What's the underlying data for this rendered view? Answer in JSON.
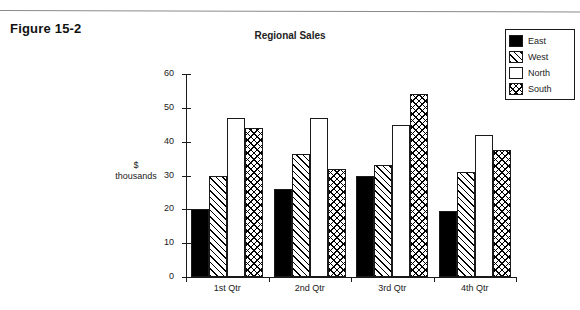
{
  "figure": {
    "label": "Figure 15-2"
  },
  "chart_data": {
    "type": "bar",
    "title": "Regional Sales",
    "xlabel": "",
    "ylabel": "$ thousands",
    "ylabel_lines": [
      "$",
      "thousands"
    ],
    "categories": [
      "1st Qtr",
      "2nd Qtr",
      "3rd Qtr",
      "4th Qtr"
    ],
    "series": [
      {
        "name": "East",
        "values": [
          20,
          26,
          30,
          19.5
        ],
        "fill": "solid"
      },
      {
        "name": "West",
        "values": [
          30,
          36.5,
          33,
          31
        ],
        "fill": "diagonal-hatch"
      },
      {
        "name": "North",
        "values": [
          47,
          47,
          45,
          42
        ],
        "fill": "none"
      },
      {
        "name": "South",
        "values": [
          44,
          32,
          54,
          37.5
        ],
        "fill": "cross-hatch"
      }
    ],
    "ylim": [
      0,
      60
    ],
    "yticks": [
      0,
      10,
      20,
      30,
      40,
      50,
      60
    ],
    "ytick_labels": [
      "0",
      "10",
      "20",
      "30",
      "40",
      "50",
      "60"
    ],
    "grid": false,
    "legend_position": "top-right",
    "legend_entries": [
      "East",
      "West",
      "North",
      "South"
    ],
    "colors": {
      "east": "#000000",
      "west": "#ffffff",
      "north": "#ffffff",
      "south": "#ffffff",
      "axis": "#1a1a1a",
      "text": "#1a1a1a",
      "background": "#ffffff"
    }
  }
}
